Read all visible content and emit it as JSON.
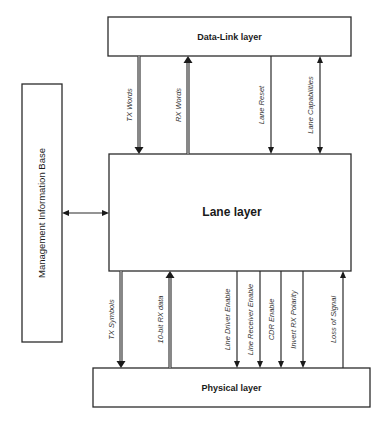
{
  "diagram": {
    "type": "layered-block-diagram",
    "blocks": {
      "data_link": "Data-Link layer",
      "lane": "Lane layer",
      "physical": "Physical layer",
      "mib": "Management Information Base"
    },
    "top_signals": [
      {
        "id": "tx-words",
        "label": "TX Words",
        "direction": "down",
        "style": "bus"
      },
      {
        "id": "rx-words",
        "label": "RX Words",
        "direction": "up",
        "style": "bus"
      },
      {
        "id": "lane-reset",
        "label": "Lane Reset",
        "direction": "down",
        "style": "line"
      },
      {
        "id": "lane-capabilities",
        "label": "Lane Capabilities",
        "direction": "both",
        "style": "line"
      }
    ],
    "side_signals": [
      {
        "id": "mib-lane-link",
        "label": "",
        "direction": "both",
        "style": "line"
      }
    ],
    "bottom_signals": [
      {
        "id": "tx-symbols",
        "label": "TX Symbols",
        "direction": "down",
        "style": "bus"
      },
      {
        "id": "rx-data",
        "label": "10-bit RX data",
        "direction": "up",
        "style": "bus"
      },
      {
        "id": "line-driver-enable",
        "label": "Line Driver Enable",
        "direction": "down",
        "style": "line"
      },
      {
        "id": "line-receiver-enable",
        "label": "Line Receiver Enable",
        "direction": "down",
        "style": "line"
      },
      {
        "id": "cdr-enable",
        "label": "CDR Enable",
        "direction": "down",
        "style": "line"
      },
      {
        "id": "invert-rx-polarity",
        "label": "Invert RX Polarity",
        "direction": "down",
        "style": "line"
      },
      {
        "id": "loss-of-signal",
        "label": "Loss of Signal",
        "direction": "up",
        "style": "line"
      }
    ]
  }
}
